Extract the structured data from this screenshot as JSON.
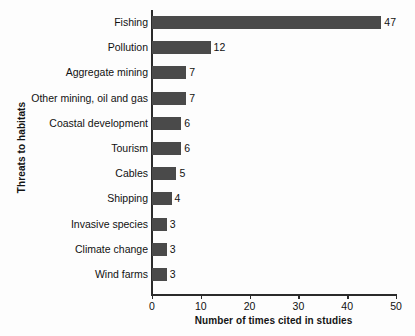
{
  "chart_data": {
    "type": "bar",
    "orientation": "horizontal",
    "title": "",
    "xlabel": "Number of times cited in studies",
    "ylabel": "Threats to habitats",
    "categories": [
      "Fishing",
      "Pollution",
      "Aggregate mining",
      "Other mining, oil and gas",
      "Coastal development",
      "Tourism",
      "Cables",
      "Shipping",
      "Invasive species",
      "Climate change",
      "Wind farms"
    ],
    "values": [
      47,
      12,
      7,
      7,
      6,
      6,
      5,
      4,
      3,
      3,
      3
    ],
    "value_labels": [
      "47",
      "12",
      "7",
      "7",
      "6",
      "6",
      "5",
      "4",
      "3",
      "3",
      "3"
    ],
    "xlim": [
      0,
      50
    ],
    "xticks": [
      0,
      10,
      20,
      30,
      40,
      50
    ],
    "xtick_labels": [
      "0",
      "10",
      "20",
      "30",
      "40",
      "50"
    ],
    "grid": false,
    "legend": null,
    "bar_color": "#4a4a4a",
    "axis_color": "#2b2b2b",
    "background_color": "#fdfdfd"
  }
}
